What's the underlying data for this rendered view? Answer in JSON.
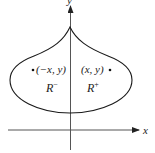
{
  "diagram": {
    "axes": {
      "x_label": "x",
      "y_label": "y"
    },
    "points": [
      {
        "label": "(−x, y)",
        "side": "left"
      },
      {
        "label": "(x, y)",
        "side": "right"
      }
    ],
    "regions": [
      {
        "name": "R",
        "sup": "−",
        "side": "left"
      },
      {
        "name": "R",
        "sup": "+",
        "side": "right"
      }
    ],
    "colors": {
      "stroke": "#1a1a1a",
      "axis": "#555555",
      "background": "#ffffff"
    }
  }
}
